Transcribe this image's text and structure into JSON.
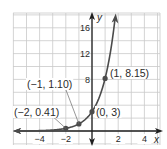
{
  "chart_data": {
    "type": "line",
    "title": "",
    "function": "y = 3e^x",
    "xlabel": "x",
    "ylabel": "y",
    "xlim": [
      -6,
      5.2
    ],
    "ylim": [
      -2,
      18
    ],
    "grid": true,
    "grid_step": {
      "x": 1,
      "y": 2
    },
    "x_ticks": [
      {
        "value": -4,
        "label": "−4"
      },
      {
        "value": -2,
        "label": "−2"
      },
      {
        "value": 2,
        "label": "2"
      },
      {
        "value": 4,
        "label": "4"
      }
    ],
    "y_ticks": [
      {
        "value": 8,
        "label": "8"
      },
      {
        "value": 12,
        "label": "12"
      },
      {
        "value": 16,
        "label": "16"
      }
    ],
    "series": [
      {
        "name": "y = 3e^x",
        "color": "#4b4b4b",
        "points": [
          {
            "x": -2,
            "y": 0.41,
            "label": "(−2, 0.41)"
          },
          {
            "x": -1,
            "y": 1.1,
            "label": "(−1, 1.10)"
          },
          {
            "x": 0,
            "y": 3,
            "label": "(0, 3)"
          },
          {
            "x": 1,
            "y": 8.15,
            "label": "(1, 8.15)"
          }
        ]
      }
    ],
    "legend": null
  },
  "colors": {
    "grid": "#c9c9c9",
    "axis": "#1f1f1f",
    "curve": "#4b4b4b"
  }
}
